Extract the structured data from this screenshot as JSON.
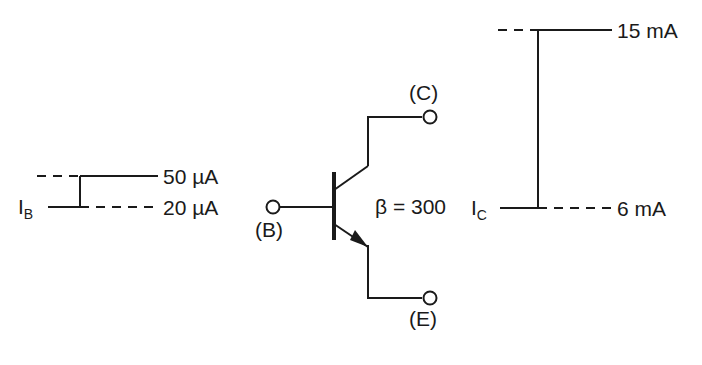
{
  "figure": {
    "background_color": "#ffffff",
    "line_color": "#1a1a1a"
  },
  "input_waveform": {
    "signal_label": "I",
    "signal_subscript": "B",
    "high_level_label": "50 µA",
    "low_level_label": "20 µA",
    "high_value": 50,
    "low_value": 20,
    "unit": "µA",
    "step_direction": "rising"
  },
  "transistor": {
    "type": "NPN",
    "gain_label": "β = 300",
    "beta": 300,
    "terminals": [
      {
        "name": "base",
        "label": "(B)"
      },
      {
        "name": "collector",
        "label": "(C)"
      },
      {
        "name": "emitter",
        "label": "(E)"
      }
    ]
  },
  "output_waveform": {
    "signal_label": "I",
    "signal_subscript": "C",
    "high_level_label": "15 mA",
    "low_level_label": "6 mA",
    "high_value": 15,
    "low_value": 6,
    "unit": "mA",
    "step_direction": "rising"
  }
}
